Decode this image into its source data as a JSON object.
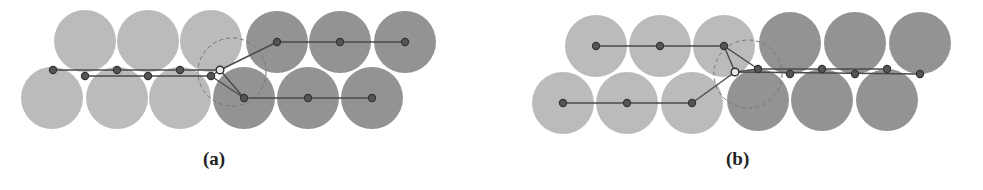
{
  "colors": {
    "light_circle": "#b4b4b4",
    "dark_circle": "#8a8a8a",
    "node_fill": "#555555",
    "node_stroke": "#333333",
    "edge": "#4a4a4a",
    "dashed": "#777777",
    "hollow_node_fill": "#e8e8e8"
  },
  "radius": 31,
  "panels": [
    {
      "id": "a",
      "caption": "(a)",
      "caption_x": 203,
      "light_circles": [
        [
          85,
          41
        ],
        [
          148,
          41
        ],
        [
          211,
          41
        ],
        [
          52,
          98
        ],
        [
          117,
          98
        ],
        [
          180,
          98
        ]
      ],
      "dark_circles": [
        [
          277,
          42
        ],
        [
          340,
          42
        ],
        [
          405,
          42
        ],
        [
          244,
          98
        ],
        [
          308,
          98
        ],
        [
          372,
          98
        ]
      ],
      "light_nodes": [
        [
          53,
          70
        ],
        [
          117,
          70
        ],
        [
          180,
          70
        ],
        [
          85,
          76
        ],
        [
          148,
          76
        ],
        [
          211,
          76
        ]
      ],
      "hollow_node": [
        220,
        70
      ],
      "dark_nodes": [
        [
          277,
          42
        ],
        [
          340,
          42
        ],
        [
          405,
          42
        ],
        [
          244,
          98
        ],
        [
          308,
          98
        ],
        [
          372,
          98
        ]
      ],
      "edges": [
        [
          [
            53,
            70
          ],
          [
            220,
            70
          ]
        ],
        [
          [
            85,
            76
          ],
          [
            211,
            76
          ]
        ],
        [
          [
            211,
            76
          ],
          [
            220,
            70
          ]
        ],
        [
          [
            220,
            70
          ],
          [
            277,
            42
          ]
        ],
        [
          [
            277,
            42
          ],
          [
            405,
            42
          ]
        ],
        [
          [
            220,
            70
          ],
          [
            244,
            98
          ]
        ],
        [
          [
            211,
            76
          ],
          [
            244,
            98
          ]
        ],
        [
          [
            244,
            98
          ],
          [
            372,
            98
          ]
        ]
      ],
      "dashed_arc": {
        "cx": 232,
        "cy": 72,
        "r": 34
      }
    },
    {
      "id": "b",
      "caption": "(b)",
      "caption_x": 726,
      "light_circles": [
        [
          596,
          46
        ],
        [
          660,
          46
        ],
        [
          724,
          46
        ],
        [
          563,
          103
        ],
        [
          627,
          103
        ],
        [
          692,
          103
        ]
      ],
      "dark_circles": [
        [
          790,
          43
        ],
        [
          855,
          43
        ],
        [
          920,
          43
        ],
        [
          758,
          100
        ],
        [
          822,
          100
        ],
        [
          887,
          100
        ]
      ],
      "light_nodes": [
        [
          596,
          46
        ],
        [
          660,
          46
        ],
        [
          724,
          46
        ],
        [
          563,
          103
        ],
        [
          627,
          103
        ],
        [
          692,
          103
        ]
      ],
      "hollow_node": [
        735,
        72
      ],
      "dark_nodes": [
        [
          758,
          69
        ],
        [
          822,
          69
        ],
        [
          887,
          69
        ],
        [
          790,
          74
        ],
        [
          855,
          74
        ],
        [
          920,
          74
        ]
      ],
      "edges": [
        [
          [
            596,
            46
          ],
          [
            724,
            46
          ]
        ],
        [
          [
            724,
            46
          ],
          [
            735,
            72
          ]
        ],
        [
          [
            724,
            46
          ],
          [
            758,
            69
          ]
        ],
        [
          [
            563,
            103
          ],
          [
            692,
            103
          ]
        ],
        [
          [
            692,
            103
          ],
          [
            735,
            72
          ]
        ],
        [
          [
            735,
            72
          ],
          [
            758,
            69
          ]
        ],
        [
          [
            758,
            69
          ],
          [
            887,
            69
          ]
        ],
        [
          [
            735,
            72
          ],
          [
            920,
            74
          ]
        ]
      ],
      "dashed_arc": {
        "cx": 748,
        "cy": 74,
        "r": 34
      }
    }
  ]
}
